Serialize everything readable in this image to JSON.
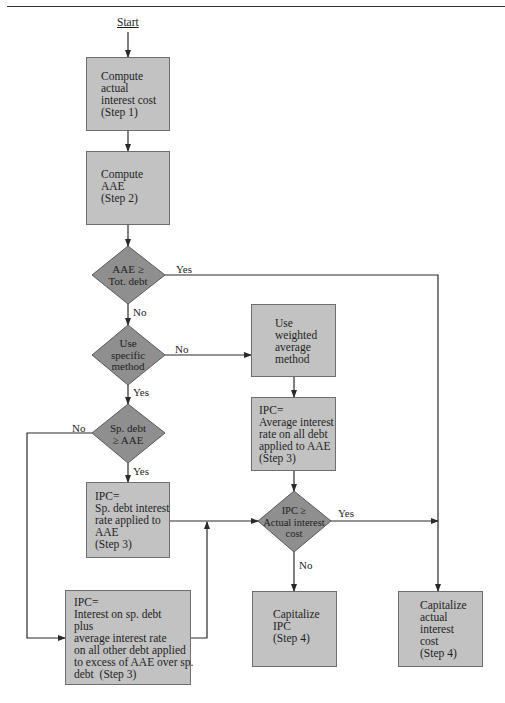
{
  "diagram": {
    "start_label": "Start",
    "boxes": {
      "compute_actual": "Compute\nactual\ninterest cost\n(Step 1)",
      "compute_aae": "Compute\nAAE\n(Step 2)",
      "weighted_method": "Use\nweighted\naverage\nmethod",
      "ipc_average": "IPC=\nAverage interest\nrate on all debt\napplied to AAE\n(Step 3)",
      "ipc_specific": "IPC=\nSp. debt interest\nrate applied to\nAAE\n(Step 3)",
      "ipc_combined": "IPC=\nInterest on sp. debt\nplus\naverage interest rate\non all other debt applied\nto excess of AAE over sp.\ndebt  (Step 3)",
      "capitalize_ipc": "Capitalize\nIPC\n(Step 4)",
      "capitalize_actual": "Capitalize\nactual\ninterest\ncost\n(Step 4)"
    },
    "decisions": {
      "aae_vs_total": "AAE ≥\nTot. debt",
      "use_specific": "Use\nspecific\nmethod",
      "spdebt_vs_aae": "Sp. debt\n≥ AAE",
      "ipc_vs_actual": "IPC ≥\nActual interest\ncost"
    },
    "edge_labels": {
      "aae_yes": "Yes",
      "aae_no": "No",
      "specific_no": "No",
      "specific_yes": "Yes",
      "spdebt_no": "No",
      "spdebt_yes": "Yes",
      "ipc_yes": "Yes",
      "ipc_no": "No"
    },
    "colors": {
      "box_fill": "#c2c2c2",
      "diamond_fill": "#8f8f8f",
      "line": "#2a2a2a"
    }
  }
}
